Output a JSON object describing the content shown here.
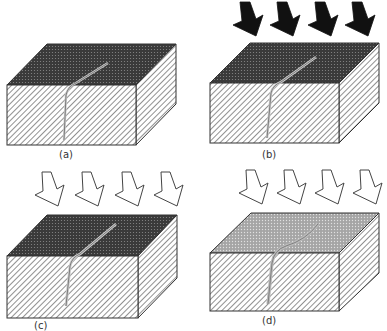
{
  "diagram": {
    "colors": {
      "dark_top": "#3a3a3a",
      "light_top": "#9a9a9a",
      "hatch_line": "#555555",
      "edge": "#333333",
      "solid_arrow": "#111111",
      "hollow_arrow_fill": "#ffffff",
      "crack_fill": "#d8d8d8"
    },
    "panels": [
      {
        "id": "a",
        "label": "(a)",
        "top_shade": "dark",
        "arrows": "none",
        "crack": "short"
      },
      {
        "id": "b",
        "label": "(b)",
        "top_shade": "dark",
        "arrows": "solid",
        "crack": "short"
      },
      {
        "id": "c",
        "label": "(c)",
        "top_shade": "dark",
        "arrows": "hollow",
        "crack": "short"
      },
      {
        "id": "d",
        "label": "(d)",
        "top_shade": "light",
        "arrows": "hollow",
        "crack": "long"
      }
    ]
  }
}
